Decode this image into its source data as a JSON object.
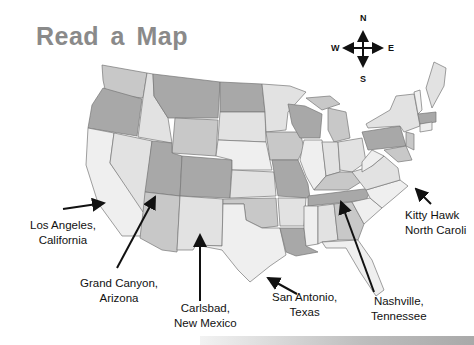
{
  "title": "Read a Map",
  "compass": {
    "north": "N",
    "south": "S",
    "east": "E",
    "west": "W"
  },
  "colors": {
    "title": "#8a8a8a",
    "state_dark": "#a8a8a8",
    "state_mid": "#c8c8c8",
    "state_light": "#e2e2e2",
    "state_lighter": "#efefef",
    "border": "#777777"
  },
  "labels": [
    {
      "id": "los-angeles",
      "line1": "Los Angeles,",
      "line2": "California"
    },
    {
      "id": "grand-canyon",
      "line1": "Grand Canyon,",
      "line2": "Arizona"
    },
    {
      "id": "carlsbad",
      "line1": "Carlsbad,",
      "line2": "New Mexico"
    },
    {
      "id": "san-antonio",
      "line1": "San Antonio,",
      "line2": "Texas"
    },
    {
      "id": "nashville",
      "line1": "Nashville,",
      "line2": "Tennessee"
    },
    {
      "id": "kitty-hawk",
      "line1": "Kitty Hawk",
      "line2": "North Caroli"
    }
  ]
}
